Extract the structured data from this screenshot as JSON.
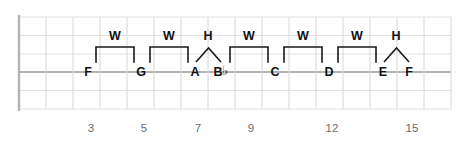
{
  "diagram": {
    "colors": {
      "fret_line": "#d6d6d6",
      "string_line": "#e2e2e2",
      "highlight_string": "#9a9a9a",
      "nut": "#b4b4b4",
      "bracket": "#1a1a1a",
      "text": "#111111",
      "fret_number_text": "#6b6b6b",
      "background": "#ffffff"
    },
    "geometry": {
      "nut_x": 19,
      "fret_spacing": 27,
      "fret_count": 16,
      "string_ys": [
        17,
        35.5,
        54,
        72,
        90.5,
        109
      ],
      "highlight_string_index": 3,
      "grid_top": 17,
      "grid_bottom": 109
    },
    "notes": [
      {
        "label": "F",
        "accidental": "",
        "x": 88,
        "y": 72
      },
      {
        "label": "G",
        "accidental": "",
        "x": 141,
        "y": 72
      },
      {
        "label": "A",
        "accidental": "",
        "x": 195,
        "y": 72
      },
      {
        "label": "B",
        "accidental": "♭",
        "x": 221,
        "y": 72
      },
      {
        "label": "C",
        "accidental": "",
        "x": 275,
        "y": 72
      },
      {
        "label": "D",
        "accidental": "",
        "x": 329,
        "y": 72
      },
      {
        "label": "E",
        "accidental": "",
        "x": 383,
        "y": 72
      },
      {
        "label": "F",
        "accidental": "",
        "x": 409,
        "y": 72
      }
    ],
    "intervals": [
      {
        "label": "W",
        "type": "whole",
        "from_x": 96,
        "to_x": 134,
        "label_x": 115,
        "label_y": 36,
        "bracket_y": 47,
        "tick_bottom": 62
      },
      {
        "label": "W",
        "type": "whole",
        "from_x": 150,
        "to_x": 188,
        "label_x": 169,
        "label_y": 36,
        "bracket_y": 47,
        "tick_bottom": 62
      },
      {
        "label": "H",
        "type": "half",
        "from_x": 196,
        "to_x": 221,
        "label_x": 208,
        "label_y": 36,
        "apex_y": 48,
        "tick_bottom": 62
      },
      {
        "label": "W",
        "type": "whole",
        "from_x": 230,
        "to_x": 268,
        "label_x": 249,
        "label_y": 36,
        "bracket_y": 47,
        "tick_bottom": 62
      },
      {
        "label": "W",
        "type": "whole",
        "from_x": 284,
        "to_x": 322,
        "label_x": 303,
        "label_y": 36,
        "bracket_y": 47,
        "tick_bottom": 62
      },
      {
        "label": "W",
        "type": "whole",
        "from_x": 338,
        "to_x": 376,
        "label_x": 357,
        "label_y": 36,
        "bracket_y": 47,
        "tick_bottom": 62
      },
      {
        "label": "H",
        "type": "half",
        "from_x": 384,
        "to_x": 409,
        "label_x": 396,
        "label_y": 36,
        "apex_y": 48,
        "tick_bottom": 62
      }
    ],
    "fret_numbers": [
      {
        "label": "3",
        "x": 91,
        "y": 129
      },
      {
        "label": "5",
        "x": 144,
        "y": 129
      },
      {
        "label": "7",
        "x": 198,
        "y": 129
      },
      {
        "label": "9",
        "x": 251,
        "y": 129
      },
      {
        "label": "12",
        "x": 332,
        "y": 129
      },
      {
        "label": "15",
        "x": 412,
        "y": 129
      }
    ]
  },
  "legend": {
    "whole_step": "W",
    "half_step": "H"
  }
}
